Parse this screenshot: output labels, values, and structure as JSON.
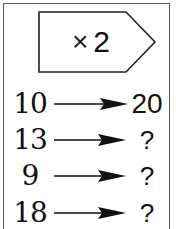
{
  "rule": {
    "operator": "×",
    "factor": "2"
  },
  "rows": [
    {
      "input": "10",
      "output": "20"
    },
    {
      "input": "13",
      "output": "?"
    },
    {
      "input": "9",
      "output": "?"
    },
    {
      "input": "18",
      "output": "?"
    }
  ],
  "colors": {
    "ink": "#111111",
    "border": "#555555",
    "background": "#ffffff"
  }
}
